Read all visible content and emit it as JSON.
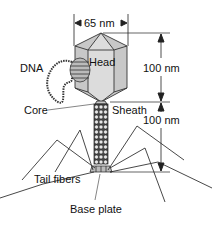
{
  "figure": {
    "labels": {
      "width_dim": "65 nm",
      "head": "Head",
      "dna": "DNA",
      "core": "Core",
      "sheath": "Sheath",
      "head_height_dim": "100 nm",
      "tail_length_dim": "100 nm",
      "tail_fibers": "Tail fibers",
      "base_plate": "Base plate"
    },
    "colors": {
      "head_fill": "#c8c8c8",
      "head_face_light": "#dcdcdc",
      "line": "#222222",
      "sheath_bead": "#333333",
      "background": "#ffffff"
    }
  }
}
